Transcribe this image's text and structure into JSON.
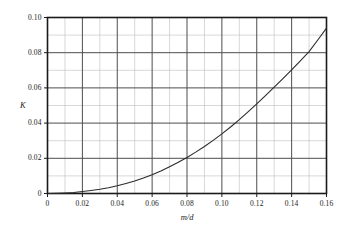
{
  "chart_data": {
    "type": "line",
    "title": "",
    "subtitle": "",
    "xlabel": "m/d",
    "ylabel": "K",
    "xlim": [
      0,
      0.16
    ],
    "ylim": [
      0,
      0.1
    ],
    "grid": true,
    "grid_major_x_step": 0.02,
    "grid_minor_x_step": 0.01,
    "grid_major_y_step": 0.02,
    "grid_minor_y_step": 0.01,
    "legend": null,
    "legend_position": "none",
    "xticks": [
      0,
      0.02,
      0.04,
      0.06,
      0.08,
      0.1,
      0.12,
      0.14,
      0.16
    ],
    "xtick_labels": [
      "0",
      "0.02",
      "0.04",
      "0.06",
      "0.08",
      "0.10",
      "0.12",
      "0.14",
      "0.16"
    ],
    "yticks": [
      0,
      0.02,
      0.04,
      0.06,
      0.08,
      0.1
    ],
    "ytick_labels": [
      "0",
      "0.02",
      "0.04",
      "0.06",
      "0.08",
      "0.10"
    ],
    "series": [
      {
        "name": "K",
        "color": "#2b2b2b",
        "line_width": 1.1,
        "x": [
          0,
          0.005,
          0.01,
          0.015,
          0.02,
          0.025,
          0.03,
          0.035,
          0.04,
          0.045,
          0.05,
          0.055,
          0.06,
          0.065,
          0.07,
          0.075,
          0.08,
          0.085,
          0.09,
          0.095,
          0.1,
          0.105,
          0.11,
          0.115,
          0.12,
          0.125,
          0.13,
          0.135,
          0.14,
          0.145,
          0.15,
          0.155,
          0.16
        ],
        "y": [
          0,
          0.0001,
          0.0003,
          0.0006,
          0.0011,
          0.0017,
          0.0024,
          0.0033,
          0.0044,
          0.0057,
          0.0071,
          0.0088,
          0.0107,
          0.0128,
          0.0152,
          0.0177,
          0.0205,
          0.0235,
          0.0267,
          0.0302,
          0.0339,
          0.0378,
          0.042,
          0.0464,
          0.0509,
          0.0556,
          0.0604,
          0.0653,
          0.0703,
          0.0754,
          0.0806,
          0.0872,
          0.094
        ]
      }
    ],
    "colors": {
      "curve": "#2b2b2b",
      "axis": "#1a1a1a",
      "grid_major": "#4d4d4d",
      "grid_minor": "#bdbdbd",
      "background": "#ffffff"
    },
    "annotations": []
  }
}
